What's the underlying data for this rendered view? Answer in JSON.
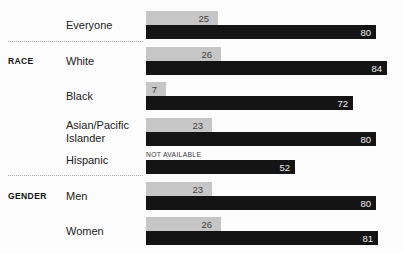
{
  "chart_data": {
    "type": "bar",
    "orientation": "horizontal",
    "title": "",
    "xlabel": "",
    "ylabel": "",
    "xlim": [
      0,
      89
    ],
    "grid": false,
    "legend": false,
    "series_names": [
      "top-gray-bar",
      "bottom-black-bar"
    ],
    "not_available_text": "NOT AVAILABLE",
    "colors": {
      "top_bar": "#c6c6c6",
      "bottom_bar": "#141414",
      "top_value_text": "#3f3f3f",
      "bottom_value_text": "#efefef",
      "category_text": "#222222",
      "group_text": "#111111",
      "separator": "#a8a8a8",
      "background": "#fcfcfc"
    },
    "rows": [
      {
        "group": "",
        "label": "Everyone",
        "top_value": 25,
        "top_label": "25",
        "bottom_value": 80,
        "bottom_label": "80"
      },
      {
        "group": "RACE",
        "label": "White",
        "top_value": 26,
        "top_label": "26",
        "bottom_value": 84,
        "bottom_label": "84"
      },
      {
        "group": "",
        "label": "Black",
        "top_value": 7,
        "top_label": "7",
        "bottom_value": 72,
        "bottom_label": "72"
      },
      {
        "group": "",
        "label": "Asian/Pacific Islander",
        "top_value": 23,
        "top_label": "23",
        "bottom_value": 80,
        "bottom_label": "80"
      },
      {
        "group": "",
        "label": "Hispanic",
        "top_value": null,
        "top_label": "NOT AVAILABLE",
        "bottom_value": 52,
        "bottom_label": "52"
      },
      {
        "group": "GENDER",
        "label": "Men",
        "top_value": 23,
        "top_label": "23",
        "bottom_value": 80,
        "bottom_label": "80"
      },
      {
        "group": "",
        "label": "Women",
        "top_value": 26,
        "top_label": "26",
        "bottom_value": 81,
        "bottom_label": "81"
      }
    ],
    "separators_after_row_index": [
      0,
      4
    ]
  }
}
